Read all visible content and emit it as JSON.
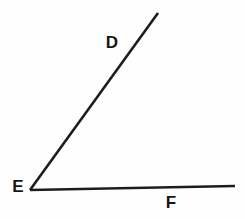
{
  "figure": {
    "type": "angle-diagram",
    "background_color": "#fefefe",
    "line_color": "#1d1d1d",
    "label_color": "#151515",
    "stroke_width": 2.6,
    "vertex": {
      "label": "E",
      "x": 30,
      "y": 190
    },
    "rays": [
      {
        "name": "ray-ED",
        "to_label": "D",
        "x2": 158,
        "y2": 13
      },
      {
        "name": "ray-EF",
        "to_label": "F",
        "x2": 235,
        "y2": 186
      }
    ],
    "labels": [
      {
        "text": "E",
        "x": 18,
        "y": 186
      },
      {
        "text": "D",
        "x": 112,
        "y": 42
      },
      {
        "text": "F",
        "x": 171,
        "y": 202
      }
    ]
  }
}
